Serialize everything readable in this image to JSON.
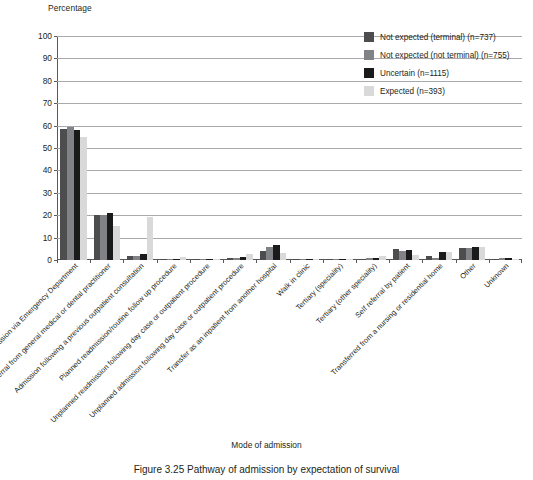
{
  "chart_data": {
    "type": "bar",
    "title": "",
    "ylabel": "Percentage",
    "xlabel": "Mode of admission",
    "ylim": [
      0,
      100
    ],
    "yticks": [
      0,
      10,
      20,
      30,
      40,
      50,
      60,
      70,
      80,
      90,
      100
    ],
    "grid": true,
    "legend_position": "top-right",
    "categories": [
      "Admission via Emergency Department",
      "Referral from general medical or dental practitioner",
      "Admission following a previous outpatient consultation",
      "Planned readmission/routine follow up procedure",
      "Unplanned readmission following day case or outpatient procedure",
      "Unplanned admission following day case or outpatient procedure",
      "Transfer as an inpatient from another hospital",
      "Walk in clinic",
      "Tertiary (speciality)",
      "Tertiary (other speciality)",
      "Self referral by patient",
      "Transferred from a nursing or residential home",
      "Other",
      "Unknown"
    ],
    "series": [
      {
        "name": "Not expected (terminal) (n=737)",
        "color": "#4d4d4f",
        "values": [
          58.5,
          20.0,
          2.0,
          0.3,
          0.2,
          0.8,
          4.2,
          0.2,
          0.3,
          0.5,
          5.0,
          2.0,
          5.5,
          0.6
        ]
      },
      {
        "name": "Not expected (not terminal) (n=755)",
        "color": "#808285",
        "values": [
          59.5,
          20.0,
          2.0,
          0.3,
          0.2,
          0.9,
          5.8,
          0.3,
          0.4,
          0.7,
          4.0,
          1.0,
          5.2,
          0.7
        ]
      },
      {
        "name": "Uncertain (n=1115)",
        "color": "#1a1a1a",
        "values": [
          58.0,
          21.0,
          2.6,
          0.4,
          0.3,
          1.2,
          6.8,
          0.3,
          0.4,
          0.9,
          4.5,
          3.5,
          5.8,
          0.8
        ]
      },
      {
        "name": "Expected (n=393)",
        "color": "#d9d9d9",
        "values": [
          55.0,
          15.0,
          19.0,
          1.5,
          0.4,
          2.5,
          3.0,
          0.4,
          0.6,
          1.6,
          2.2,
          3.8,
          6.0,
          0.5
        ]
      }
    ]
  },
  "legend": {
    "items": [
      {
        "label": "Not expected (terminal) (n=737)"
      },
      {
        "label": "Not expected (not terminal) (n=755)"
      },
      {
        "label": "Uncertain (n=1115)"
      },
      {
        "label": "Expected (n=393)"
      }
    ]
  },
  "caption": "Figure 3.25 Pathway of admission by expectation of survival"
}
